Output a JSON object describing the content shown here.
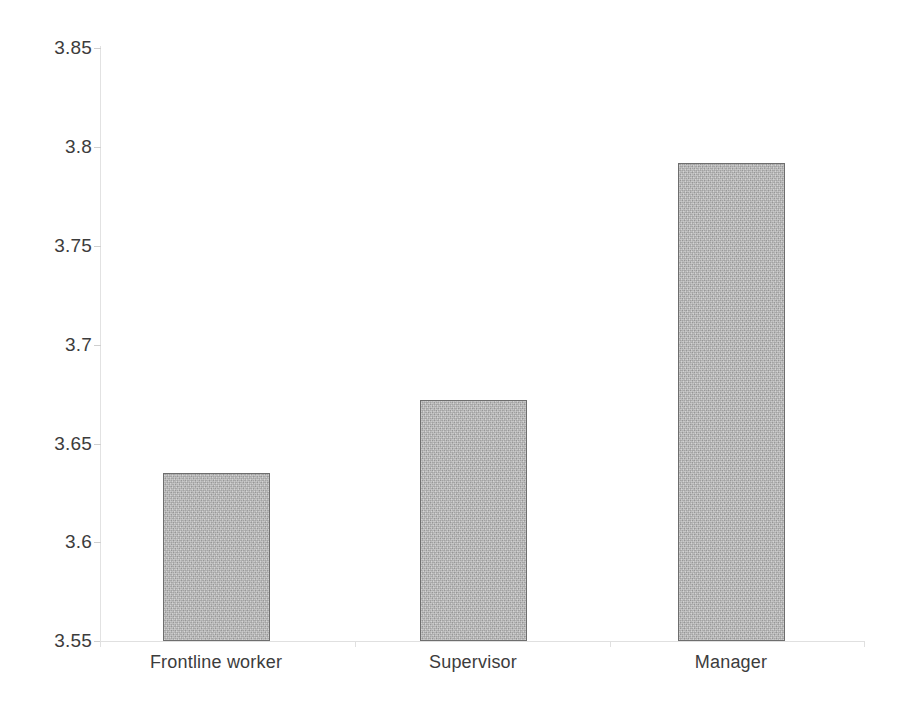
{
  "chart_data": {
    "type": "bar",
    "title": "",
    "subtitle": "",
    "xlabel": "",
    "ylabel": "",
    "categories": [
      "Frontline worker",
      "Supervisor",
      "Manager"
    ],
    "values": [
      3.635,
      3.672,
      3.792
    ],
    "series": [
      {
        "name": "",
        "values": [
          3.635,
          3.672,
          3.792
        ]
      }
    ],
    "ylim": [
      3.55,
      3.85
    ],
    "y_ticks": [
      3.55,
      3.6,
      3.65,
      3.7,
      3.75,
      3.8,
      3.85
    ],
    "y_tick_labels": [
      "3.55",
      "3.6",
      "3.65",
      "3.7",
      "3.75",
      "3.8",
      "3.85"
    ],
    "grid": false,
    "legend": null,
    "legend_position": "none",
    "annotations": [],
    "colors": {
      "bar_fill": "#b6b6b6",
      "bar_border": "#6e6e6e",
      "axis": "#e0e0e0",
      "tick_mark": "#cfcfcf",
      "text": "#3c3c3c",
      "background": "#ffffff"
    }
  }
}
